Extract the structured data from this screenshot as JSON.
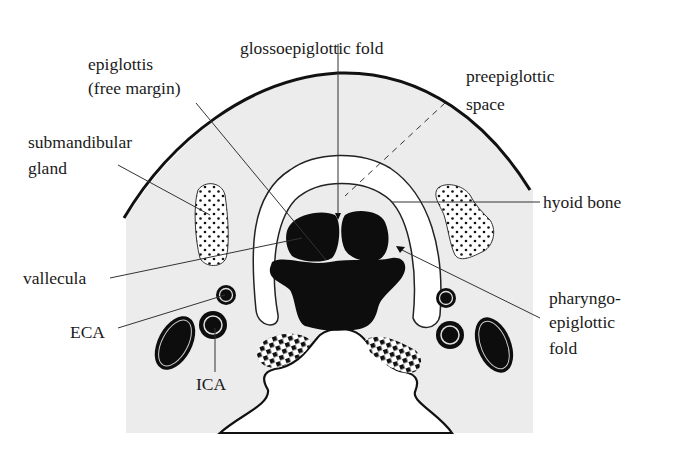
{
  "figure": {
    "colors": {
      "background": "#ffffff",
      "tissue": "#ececec",
      "structure_fill": "#0d0d0d",
      "outline": "#111111",
      "hyoid_fill": "#ffffff"
    }
  },
  "labels": {
    "glossoepiglottic_fold": "glossoepiglottic fold",
    "epiglottis_line1": "epiglottis",
    "epiglottis_line2": "(free margin)",
    "preepiglottic_line1": "preepiglottic",
    "preepiglottic_line2": "space",
    "submandibular_line1": "submandibular",
    "submandibular_line2": "gland",
    "hyoid_bone": "hyoid bone",
    "vallecula": "vallecula",
    "pharyngo_line1": "pharyngo-",
    "pharyngo_line2": "epiglottic",
    "pharyngo_line3": "fold",
    "eca": "ECA",
    "ica": "ICA"
  }
}
